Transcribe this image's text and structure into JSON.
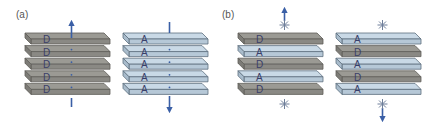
{
  "panels": [
    {
      "label": "(a)",
      "stacks": [
        {
          "layers": [
            "D",
            "D",
            "D",
            "D",
            "D"
          ],
          "arrow": "up-top",
          "transition_dipole": "none"
        },
        {
          "layers": [
            "A",
            "A",
            "A",
            "A",
            "A"
          ],
          "arrow": "down-bottom",
          "transition_dipole": "none"
        }
      ]
    },
    {
      "label": "(b)",
      "stacks": [
        {
          "layers": [
            "D",
            "A",
            "D",
            "A",
            "D"
          ],
          "arrow": "up-top",
          "marks": [
            "star-top",
            "star-bottom"
          ]
        },
        {
          "layers": [
            "A",
            "D",
            "A",
            "D",
            "A"
          ],
          "arrow": "down-bottom",
          "marks": [
            "star-top",
            "star-bottom"
          ]
        }
      ]
    }
  ],
  "colors": {
    "donor_fill": "#9b9a94",
    "donor_edge": "#5f5e59",
    "acceptor_fill": "#c9d9e6",
    "acceptor_edge": "#5d6e7e",
    "arrow": "#3a5fa6",
    "star": "#6f7f9a"
  }
}
